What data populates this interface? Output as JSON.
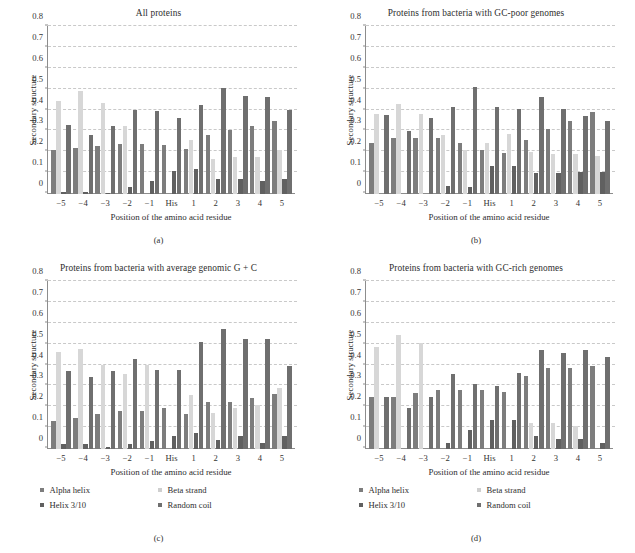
{
  "figure": {
    "legend_labels": [
      "Alpha helix",
      "Beta strand",
      "Helix 3/10",
      "Random coil"
    ],
    "colors": {
      "alpha_helix": "#7d7d7d",
      "beta_strand": "#d7d7d7",
      "helix_3_10": "#606060",
      "random_coil": "#6f6f6f",
      "axis": "#8d8d8d",
      "grid": "#c9c9c9",
      "background": "#ffffff"
    },
    "subcaptions": [
      "(a)",
      "(b)",
      "(c)",
      "(d)"
    ]
  },
  "chart_data": [
    {
      "type": "bar",
      "title": "All proteins",
      "subcaption": "(a)",
      "xlabel": "Position of the amino acid residue",
      "ylabel": "Secondary structure",
      "categories": [
        "−5",
        "−4",
        "−3",
        "−2",
        "−1",
        "His",
        "1",
        "2",
        "3",
        "4",
        "5"
      ],
      "ylim": [
        0,
        0.8
      ],
      "yticks": [
        "0",
        "0.1",
        "0.2",
        "0.3",
        "0.4",
        "0.5",
        "0.6",
        "0.7",
        "0.8"
      ],
      "grid": true,
      "legend_position": "below-figure",
      "series": [
        {
          "name": "Alpha helix",
          "values": [
            0.21,
            0.22,
            0.23,
            0.24,
            0.24,
            0.235,
            0.215,
            0.28,
            0.305,
            0.325,
            0.35
          ]
        },
        {
          "name": "Beta strand",
          "values": [
            0.445,
            0.49,
            0.435,
            0.325,
            0.0,
            0.0,
            0.255,
            0.165,
            0.175,
            0.175,
            0.21
          ]
        },
        {
          "name": "Helix 3/10",
          "values": [
            0.01,
            0.01,
            0.005,
            0.035,
            0.06,
            0.11,
            0.12,
            0.07,
            0.07,
            0.06,
            0.07
          ]
        },
        {
          "name": "Random coil",
          "values": [
            0.33,
            0.28,
            0.325,
            0.4,
            0.395,
            0.36,
            0.425,
            0.505,
            0.465,
            0.46,
            0.4
          ]
        }
      ]
    },
    {
      "type": "bar",
      "title": "Proteins from bacteria with GC-poor genomes",
      "subcaption": "(b)",
      "xlabel": "Position of the amino acid residue",
      "ylabel": "Secondary structure",
      "categories": [
        "−5",
        "−4",
        "−3",
        "−2",
        "−1",
        "His",
        "1",
        "2",
        "3",
        "4",
        "5"
      ],
      "ylim": [
        0,
        0.8
      ],
      "yticks": [
        "0",
        "0.1",
        "0.2",
        "0.3",
        "0.4",
        "0.5",
        "0.6",
        "0.7",
        "0.8"
      ],
      "grid": true,
      "legend_position": "below-figure",
      "series": [
        {
          "name": "Alpha helix",
          "values": [
            0.245,
            0.265,
            0.265,
            0.265,
            0.245,
            0.21,
            0.195,
            0.255,
            0.31,
            0.35,
            0.39
          ]
        },
        {
          "name": "Beta strand",
          "values": [
            0.38,
            0.43,
            0.38,
            0.28,
            0.21,
            0.245,
            0.285,
            0.2,
            0.19,
            0.19,
            0.18
          ]
        },
        {
          "name": "Helix 3/10",
          "values": [
            0.0,
            0.0,
            0.0,
            0.04,
            0.035,
            0.135,
            0.135,
            0.1,
            0.1,
            0.105,
            0.105
          ]
        },
        {
          "name": "Random coil",
          "values": [
            0.375,
            0.3,
            0.36,
            0.415,
            0.51,
            0.415,
            0.405,
            0.46,
            0.405,
            0.37,
            0.35
          ]
        }
      ]
    },
    {
      "type": "bar",
      "title": "Proteins from bacteria with average genomic G + C",
      "subcaption": "(c)",
      "xlabel": "Position of the amino acid residue",
      "ylabel": "Secondary structure",
      "categories": [
        "−5",
        "−4",
        "−3",
        "−2",
        "−1",
        "His",
        "1",
        "2",
        "3",
        "4",
        "5"
      ],
      "ylim": [
        0,
        0.8
      ],
      "yticks": [
        "0",
        "0.1",
        "0.2",
        "0.3",
        "0.4",
        "0.5",
        "0.6",
        "0.7",
        "0.8"
      ],
      "grid": true,
      "legend_position": "below-panel",
      "series": [
        {
          "name": "Alpha helix",
          "values": [
            0.135,
            0.15,
            0.165,
            0.18,
            0.18,
            0.195,
            0.165,
            0.225,
            0.225,
            0.245,
            0.26
          ]
        },
        {
          "name": "Beta strand",
          "values": [
            0.46,
            0.475,
            0.4,
            0.355,
            0.4,
            0.0,
            0.255,
            0.17,
            0.195,
            0.21,
            0.29
          ]
        },
        {
          "name": "Helix 3/10",
          "values": [
            0.025,
            0.025,
            0.01,
            0.025,
            0.04,
            0.06,
            0.075,
            0.045,
            0.06,
            0.03,
            0.06
          ]
        },
        {
          "name": "Random coil",
          "values": [
            0.37,
            0.345,
            0.37,
            0.43,
            0.375,
            0.375,
            0.51,
            0.57,
            0.525,
            0.525,
            0.395
          ]
        }
      ]
    },
    {
      "type": "bar",
      "title": "Proteins from bacteria with GC-rich genomes",
      "subcaption": "(d)",
      "xlabel": "Position of the amino acid residue",
      "ylabel": "Secondary structure",
      "categories": [
        "−5",
        "−4",
        "−3",
        "−2",
        "−1",
        "His",
        "1",
        "2",
        "3",
        "4",
        "5"
      ],
      "ylim": [
        0,
        0.8
      ],
      "yticks": [
        "0",
        "0.1",
        "0.2",
        "0.3",
        "0.4",
        "0.5",
        "0.6",
        "0.7",
        "0.8"
      ],
      "grid": true,
      "legend_position": "below-panel",
      "series": [
        {
          "name": "Alpha helix",
          "values": [
            0.25,
            0.25,
            0.265,
            0.28,
            0.28,
            0.28,
            0.27,
            0.35,
            0.385,
            0.385,
            0.395
          ]
        },
        {
          "name": "Beta strand",
          "values": [
            0.485,
            0.545,
            0.505,
            0.0,
            0.0,
            0.0,
            0.0,
            0.125,
            0.125,
            0.11,
            0.0
          ]
        },
        {
          "name": "Helix 3/10",
          "values": [
            0.0,
            0.0,
            0.0,
            0.03,
            0.09,
            0.14,
            0.14,
            0.06,
            0.05,
            0.05,
            0.03
          ]
        },
        {
          "name": "Random coil",
          "values": [
            0.25,
            0.195,
            0.25,
            0.355,
            0.31,
            0.3,
            0.36,
            0.47,
            0.455,
            0.47,
            0.44
          ]
        }
      ]
    }
  ]
}
